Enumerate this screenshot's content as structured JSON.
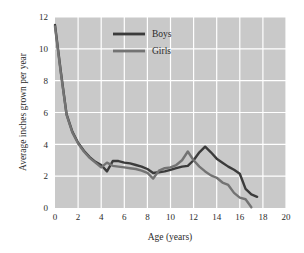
{
  "chart_data": {
    "type": "line",
    "title": "",
    "xlabel": "Age (years)",
    "ylabel": "Average inches grown per year",
    "xlim": [
      0,
      20
    ],
    "ylim": [
      0,
      12
    ],
    "xticks": [
      0,
      2,
      4,
      6,
      8,
      10,
      12,
      14,
      16,
      18,
      20
    ],
    "xtick_labels": [
      "0",
      "2",
      "4",
      "6",
      "8",
      "10",
      "12",
      "14",
      "16",
      "18",
      "20"
    ],
    "yticks": [
      0,
      2,
      4,
      6,
      8,
      10,
      12
    ],
    "ytick_labels": [
      "0",
      "2",
      "4",
      "6",
      "8",
      "10",
      "12"
    ],
    "grid": true,
    "grid_color": "#ffffff",
    "plot_background": "#c9c9c9",
    "legend_position": "top-center",
    "series": [
      {
        "name": "Boys",
        "color": "#3b3b3b",
        "x": [
          0,
          0.5,
          1,
          1.5,
          2,
          2.5,
          3,
          3.5,
          4,
          4.5,
          5,
          5.5,
          6,
          6.5,
          7,
          7.5,
          8,
          8.5,
          9,
          9.5,
          10,
          10.5,
          11,
          11.5,
          12,
          12.5,
          13,
          13.5,
          14,
          14.5,
          15,
          15.5,
          16,
          16.5,
          17,
          17.5
        ],
        "y": [
          11.5,
          8.6,
          5.9,
          4.8,
          4.1,
          3.6,
          3.2,
          2.9,
          2.7,
          2.3,
          2.95,
          2.95,
          2.85,
          2.8,
          2.7,
          2.6,
          2.45,
          2.2,
          2.25,
          2.3,
          2.4,
          2.5,
          2.6,
          2.65,
          3.0,
          3.5,
          3.85,
          3.5,
          3.1,
          2.85,
          2.6,
          2.4,
          2.15,
          1.2,
          0.85,
          0.7
        ]
      },
      {
        "name": "Girls",
        "color": "#737373",
        "x": [
          0,
          0.5,
          1,
          1.5,
          2,
          2.5,
          3,
          3.5,
          4,
          4.5,
          5,
          5.5,
          6,
          6.5,
          7,
          7.5,
          8,
          8.5,
          9,
          9.5,
          10,
          10.5,
          11,
          11.5,
          12,
          12.5,
          13,
          13.5,
          14,
          14.5,
          15,
          15.5,
          16,
          16.5,
          17
        ],
        "y": [
          11.4,
          8.5,
          5.85,
          4.75,
          4.05,
          3.55,
          3.15,
          2.85,
          2.55,
          2.85,
          2.65,
          2.6,
          2.55,
          2.5,
          2.45,
          2.35,
          2.2,
          1.85,
          2.35,
          2.5,
          2.55,
          2.7,
          3.0,
          3.55,
          3.0,
          2.6,
          2.3,
          2.05,
          1.9,
          1.6,
          1.45,
          0.95,
          0.65,
          0.55,
          0.05
        ]
      }
    ],
    "legend": [
      {
        "label": "Boys",
        "color": "#3b3b3b"
      },
      {
        "label": "Girls",
        "color": "#737373"
      }
    ]
  }
}
